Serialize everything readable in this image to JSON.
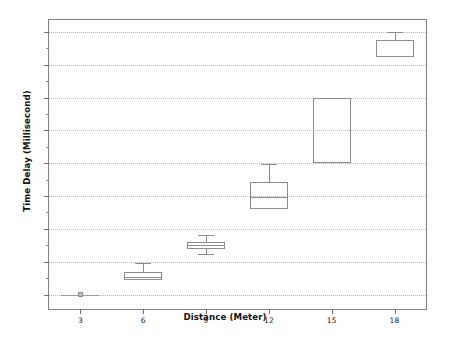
{
  "chart_data": {
    "type": "box",
    "title": "",
    "xlabel": "Distance (Meter)",
    "ylabel": "Time Delay (Millisecond)",
    "grid": true,
    "legend": "none",
    "xlim": [
      1.5,
      19.5
    ],
    "ylim": [
      78,
      518
    ],
    "xticks": [
      3,
      6,
      9,
      12,
      15,
      18
    ],
    "xtick_labels": [
      "3",
      "6",
      "9",
      "12",
      "15",
      "18"
    ],
    "yticks": [
      100,
      150,
      200,
      250,
      300,
      350,
      400,
      450,
      500
    ],
    "ytick_labels": [
      "100",
      "150",
      "200",
      "250",
      "300",
      "350",
      "400",
      "450",
      "500"
    ],
    "categories": [
      "3",
      "6",
      "9",
      "12",
      "15",
      "18"
    ],
    "boxes": [
      {
        "category": "3",
        "x": 3,
        "whisker_low": 100,
        "q1": 100,
        "median": 100,
        "q3": 100,
        "whisker_high": 100,
        "degenerate": true
      },
      {
        "category": "6",
        "x": 6,
        "whisker_low": 122,
        "q1": 122,
        "median": 126,
        "q3": 134,
        "whisker_high": 148,
        "degenerate": false
      },
      {
        "category": "9",
        "x": 9,
        "whisker_low": 162,
        "q1": 169,
        "median": 175,
        "q3": 180,
        "whisker_high": 190,
        "degenerate": false
      },
      {
        "category": "12",
        "x": 12,
        "whisker_low": 230,
        "q1": 230,
        "median": 249,
        "q3": 272,
        "whisker_high": 299,
        "degenerate": false
      },
      {
        "category": "15",
        "x": 15,
        "whisker_low": 300,
        "q1": 300,
        "median": 300,
        "q3": 399,
        "whisker_high": 399,
        "degenerate": false
      },
      {
        "category": "18",
        "x": 18,
        "whisker_low": 462,
        "q1": 462,
        "median": 462,
        "q3": 487,
        "whisker_high": 499,
        "degenerate": false
      }
    ]
  },
  "style": {
    "frame_color": "#808080",
    "grid_color": "#b8b8b8",
    "box_color": "#8a8a8a",
    "text_color": "#1a1a1a",
    "background": "#ffffff"
  }
}
